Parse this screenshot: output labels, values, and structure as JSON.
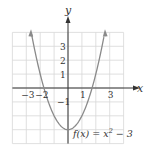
{
  "chart_data": {
    "type": "line",
    "title": "",
    "function_label": "f(x) = x² − 3",
    "function_label_parts": {
      "f": "f(x) = x",
      "exp": "2",
      "rest": " − 3"
    },
    "xlabel": "x",
    "ylabel": "y",
    "xlim": [
      -4,
      4
    ],
    "ylim": [
      -4,
      4
    ],
    "grid": true,
    "x_tick_labels": [
      {
        "value": -3,
        "label": "−3"
      },
      {
        "value": -2,
        "label": "−2"
      },
      {
        "value": 1,
        "label": "1"
      },
      {
        "value": 3,
        "label": "3"
      }
    ],
    "y_tick_labels": [
      {
        "value": 3,
        "label": "3"
      },
      {
        "value": 2,
        "label": "2"
      },
      {
        "value": 1,
        "label": "1"
      },
      {
        "value": -1,
        "label": "−1"
      }
    ],
    "series": [
      {
        "name": "f(x) = x^2 - 3",
        "x": [
          -2.65,
          -2,
          -1.5,
          -1,
          -0.5,
          0,
          0.5,
          1,
          1.5,
          2,
          2.65
        ],
        "y": [
          4.02,
          1,
          -0.75,
          -2,
          -2.75,
          -3,
          -2.75,
          -2,
          -0.75,
          1,
          4.02
        ]
      }
    ],
    "colors": {
      "curve": "#8a8a8a",
      "grid": "#d8d8d8",
      "axis": "#333333"
    }
  }
}
